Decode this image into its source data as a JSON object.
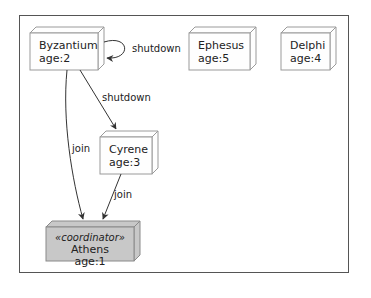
{
  "diagram": {
    "type": "node-graph",
    "frame": {
      "color": "#555555"
    },
    "colors": {
      "node_fill": "#fefefe",
      "node_stroke": "#9a9a9a",
      "coordinator_fill": "#c8c8c8",
      "edge": "#333333"
    },
    "nodes": [
      {
        "id": "byzantium",
        "name": "Byzantium",
        "age": "age:2"
      },
      {
        "id": "ephesus",
        "name": "Ephesus",
        "age": "age:5"
      },
      {
        "id": "delphi",
        "name": "Delphi",
        "age": "age:4"
      },
      {
        "id": "cyrene",
        "name": "Cyrene",
        "age": "age:3"
      },
      {
        "id": "athens",
        "stereotype": "«coordinator»",
        "name": "Athens",
        "age": "age:1"
      }
    ],
    "edges": [
      {
        "from": "byzantium",
        "to": "byzantium",
        "label": "shutdown"
      },
      {
        "from": "byzantium",
        "to": "cyrene",
        "label": "shutdown"
      },
      {
        "from": "byzantium",
        "to": "athens",
        "label": "join"
      },
      {
        "from": "cyrene",
        "to": "athens",
        "label": "join"
      }
    ]
  }
}
